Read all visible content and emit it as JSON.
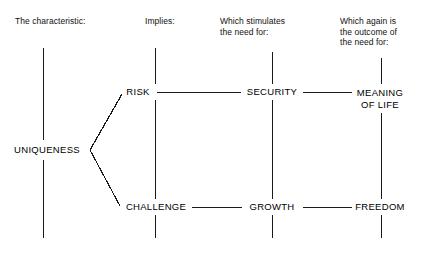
{
  "diagram": {
    "background_color": "#ffffff",
    "line_color": "#1a1a1a",
    "text_color": "#000000",
    "columns": [
      {
        "id": "characteristic",
        "header": "The characteristic:"
      },
      {
        "id": "implies",
        "header": "Implies:"
      },
      {
        "id": "stimulates",
        "header": "Which stimulates\nthe need for:"
      },
      {
        "id": "outcome",
        "header": "Which again is\nthe outcome of\nthe need for:"
      }
    ],
    "nodes": [
      {
        "id": "uniqueness",
        "label": "UNIQUENESS"
      },
      {
        "id": "risk",
        "label": "RISK"
      },
      {
        "id": "security",
        "label": "SECURITY"
      },
      {
        "id": "meaning-of-life",
        "label": "MEANING\nOF LIFE"
      },
      {
        "id": "challenge",
        "label": "CHALLENGE"
      },
      {
        "id": "growth",
        "label": "GROWTH"
      },
      {
        "id": "freedom",
        "label": "FREEDOM"
      }
    ],
    "connections": [
      {
        "from": "uniqueness",
        "to": "risk"
      },
      {
        "from": "uniqueness",
        "to": "challenge"
      },
      {
        "from": "risk",
        "to": "security"
      },
      {
        "from": "security",
        "to": "meaning-of-life"
      },
      {
        "from": "challenge",
        "to": "growth"
      },
      {
        "from": "growth",
        "to": "freedom"
      }
    ]
  }
}
